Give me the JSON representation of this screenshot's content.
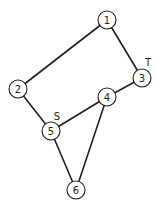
{
  "diagram": {
    "type": "undirected-graph",
    "nodes": [
      {
        "id": "1",
        "label": "1",
        "x": 107,
        "y": 20
      },
      {
        "id": "2",
        "label": "2",
        "x": 18,
        "y": 89
      },
      {
        "id": "3",
        "label": "3",
        "x": 142,
        "y": 78,
        "tag": "T"
      },
      {
        "id": "4",
        "label": "4",
        "x": 107,
        "y": 97
      },
      {
        "id": "5",
        "label": "5",
        "x": 51,
        "y": 131,
        "tag": "S"
      },
      {
        "id": "6",
        "label": "6",
        "x": 76,
        "y": 190
      }
    ],
    "edges": [
      {
        "from": "1",
        "to": "2"
      },
      {
        "from": "1",
        "to": "3"
      },
      {
        "from": "2",
        "to": "5"
      },
      {
        "from": "3",
        "to": "4"
      },
      {
        "from": "4",
        "to": "5"
      },
      {
        "from": "4",
        "to": "6"
      },
      {
        "from": "5",
        "to": "6"
      }
    ],
    "tags": {
      "source": {
        "label": "S",
        "node": "5",
        "x": 57,
        "y": 116
      },
      "target": {
        "label": "T",
        "node": "3",
        "x": 148,
        "y": 62
      }
    },
    "colors": {
      "line": "#231f20",
      "background": "#ffffff"
    }
  }
}
